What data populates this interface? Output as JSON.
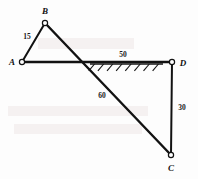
{
  "figure": {
    "type": "statics-frame-diagram",
    "canvas": {
      "width": 198,
      "height": 179
    },
    "stroke_color": "#121212",
    "background_color": "#fdfdfd"
  },
  "nodes": [
    {
      "id": "A",
      "label": "A",
      "x": 22,
      "y": 62,
      "label_x": 12,
      "label_y": 65
    },
    {
      "id": "B",
      "label": "B",
      "x": 45,
      "y": 23,
      "label_x": 45,
      "label_y": 14
    },
    {
      "id": "C",
      "label": "C",
      "x": 171,
      "y": 155,
      "label_x": 171,
      "label_y": 171
    },
    {
      "id": "D",
      "label": "D",
      "x": 172,
      "y": 62,
      "label_x": 183,
      "label_y": 66
    }
  ],
  "members": [
    {
      "id": "AB",
      "from": "A",
      "to": "B",
      "length_label": "15",
      "label_x": 27,
      "label_y": 39,
      "thickness": 2.0
    },
    {
      "id": "BC",
      "from": "B",
      "to": "C",
      "length_label": "60",
      "label_x": 102,
      "label_y": 98,
      "thickness": 2.4
    },
    {
      "id": "AD",
      "from": "A",
      "to": "D",
      "length_label": "50",
      "label_x": 123,
      "label_y": 57,
      "thickness": 2.4
    },
    {
      "id": "DC",
      "from": "D",
      "to": "C",
      "length_label": "30",
      "label_x": 182,
      "label_y": 110,
      "thickness": 2.0
    }
  ],
  "support": {
    "name": "hatched-ground-support",
    "along_member": "AD",
    "start_x": 90,
    "end_x": 163,
    "y": 64,
    "hatch_count": 8,
    "hatch_length": 9,
    "hatch_angle_deg": 50
  },
  "dimension_labels": [
    "15",
    "50",
    "60",
    "30"
  ],
  "node_labels": [
    "A",
    "B",
    "C",
    "D"
  ]
}
